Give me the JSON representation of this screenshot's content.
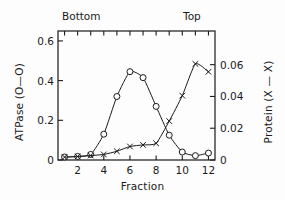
{
  "figure": {
    "title": "",
    "top_left_label": "Bottom",
    "top_right_label": "Top"
  },
  "chart_data": {
    "type": "line",
    "title": "",
    "xlabel": "Fraction",
    "ylabel": "ATPase (O—O)",
    "ylabel_right": "Protein (X — X)",
    "xlim": [
      0.5,
      12.5
    ],
    "ylim": [
      0,
      0.65
    ],
    "ylim_right": [
      0,
      0.0812
    ],
    "grid": false,
    "legend": "inline-in-axis-labels",
    "x": [
      1,
      2,
      3,
      4,
      5,
      6,
      7,
      8,
      9,
      10,
      11,
      12
    ],
    "xticks": [
      "2",
      "4",
      "6",
      "8",
      "10",
      "12"
    ],
    "xtick_values": [
      2,
      4,
      6,
      8,
      10,
      12
    ],
    "yticks_left": [
      "0",
      "0.2",
      "0.4",
      "0.6"
    ],
    "ytick_values_left": [
      0,
      0.2,
      0.4,
      0.6
    ],
    "yticks_right": [
      "0",
      "0.02",
      "0.04",
      "0.06"
    ],
    "ytick_values_right": [
      0,
      0.02,
      0.04,
      0.06
    ],
    "series": [
      {
        "name": "ATPase (O—O)",
        "marker": "circle",
        "axis": "left",
        "values": [
          0.015,
          0.018,
          0.028,
          0.13,
          0.32,
          0.445,
          0.415,
          0.27,
          0.125,
          0.04,
          0.022,
          0.035
        ]
      },
      {
        "name": "Protein (X — X)",
        "marker": "x",
        "axis": "right",
        "values": [
          0.0018,
          0.0022,
          0.0028,
          0.0035,
          0.0055,
          0.0085,
          0.0095,
          0.0105,
          0.0245,
          0.0405,
          0.0605,
          0.0555
        ]
      }
    ]
  }
}
